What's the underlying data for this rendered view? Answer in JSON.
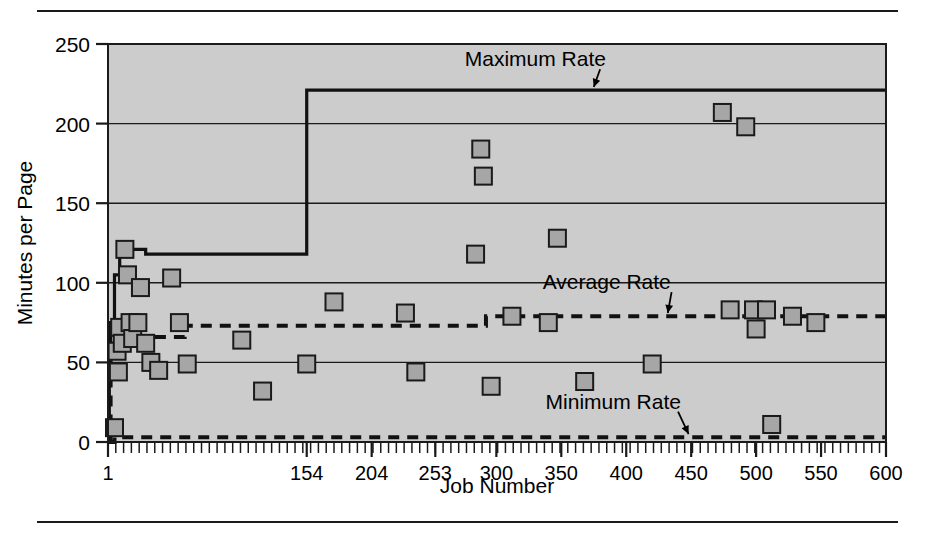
{
  "figure": {
    "rules": {
      "top": true,
      "bottom": true
    }
  },
  "chart_data": {
    "type": "scatter",
    "title": "",
    "xlabel": "Job Number",
    "ylabel": "Minutes per Page",
    "xlim": [
      1,
      600
    ],
    "ylim": [
      0,
      250
    ],
    "grid": true,
    "grid_axis": "y",
    "legend": "none",
    "plot_background": "#cccccc",
    "marker_fill": "#a6a6a6",
    "marker_edge": "#1a1a1a",
    "xticks": [
      1,
      154,
      204,
      253,
      300,
      350,
      400,
      450,
      500,
      550,
      600
    ],
    "xticklabels": [
      "1",
      "154",
      "204",
      "253",
      "300",
      "350",
      "400",
      "450",
      "500",
      "550",
      "600"
    ],
    "yticks": [
      0,
      50,
      100,
      150,
      200,
      250
    ],
    "yticklabels": [
      "0",
      "50",
      "100",
      "150",
      "200",
      "250"
    ],
    "minor_xticks": true,
    "series": [
      {
        "name": "Observed job rate",
        "type": "scatter",
        "marker": "square",
        "points": [
          [
            6,
            9
          ],
          [
            8,
            57
          ],
          [
            9,
            44
          ],
          [
            10,
            72
          ],
          [
            12,
            62
          ],
          [
            14,
            121
          ],
          [
            16,
            105
          ],
          [
            18,
            75
          ],
          [
            20,
            65
          ],
          [
            24,
            75
          ],
          [
            26,
            97
          ],
          [
            30,
            62
          ],
          [
            34,
            50
          ],
          [
            40,
            45
          ],
          [
            50,
            103
          ],
          [
            56,
            75
          ],
          [
            62,
            49
          ],
          [
            104,
            64
          ],
          [
            120,
            32
          ],
          [
            154,
            49
          ],
          [
            175,
            88
          ],
          [
            230,
            81
          ],
          [
            238,
            44
          ],
          [
            284,
            118
          ],
          [
            288,
            184
          ],
          [
            290,
            167
          ],
          [
            296,
            35
          ],
          [
            312,
            79
          ],
          [
            340,
            75
          ],
          [
            347,
            128
          ],
          [
            368,
            38
          ],
          [
            420,
            49
          ],
          [
            474,
            207
          ],
          [
            480,
            83
          ],
          [
            492,
            198
          ],
          [
            498,
            83
          ],
          [
            500,
            71
          ],
          [
            508,
            83
          ],
          [
            512,
            11
          ],
          [
            528,
            79
          ],
          [
            546,
            75
          ]
        ]
      },
      {
        "name": "Maximum Rate",
        "type": "step",
        "style": "solid",
        "annotation": "Maximum Rate",
        "points": [
          [
            1,
            0
          ],
          [
            2,
            62
          ],
          [
            3,
            75
          ],
          [
            6,
            105
          ],
          [
            10,
            118
          ],
          [
            14,
            121
          ],
          [
            30,
            118
          ],
          [
            154,
            118
          ],
          [
            154,
            221
          ],
          [
            600,
            221
          ]
        ]
      },
      {
        "name": "Average Rate",
        "type": "step",
        "style": "dashed",
        "annotation": "Average Rate",
        "points": [
          [
            1,
            0
          ],
          [
            3,
            57
          ],
          [
            6,
            62
          ],
          [
            14,
            66
          ],
          [
            40,
            66
          ],
          [
            60,
            73
          ],
          [
            284,
            73
          ],
          [
            292,
            79
          ],
          [
            600,
            79
          ]
        ]
      },
      {
        "name": "Minimum Rate",
        "type": "step",
        "style": "dashed",
        "annotation": "Minimum Rate",
        "points": [
          [
            1,
            0
          ],
          [
            6,
            3
          ],
          [
            600,
            3
          ]
        ]
      }
    ],
    "annotations": [
      {
        "text": "Maximum Rate",
        "x": 330,
        "y": 236,
        "arrow_to_x": 375,
        "arrow_to_y": 223
      },
      {
        "text": "Average Rate",
        "x": 385,
        "y": 96,
        "arrow_to_x": 432,
        "arrow_to_y": 81
      },
      {
        "text": "Minimum Rate",
        "x": 390,
        "y": 21,
        "arrow_to_x": 448,
        "arrow_to_y": 5
      }
    ]
  }
}
